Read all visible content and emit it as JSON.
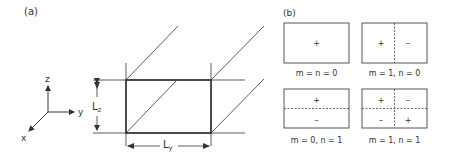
{
  "panel_a": {
    "label": "(a)",
    "axes": {
      "z": "z",
      "y": "y",
      "x": "x"
    },
    "dimension_z": {
      "main": "L",
      "sub": "z"
    },
    "dimension_y": {
      "main": "L",
      "sub": "y"
    }
  },
  "panel_b": {
    "label": "(b)",
    "modes": [
      {
        "caption": "m = n = 0",
        "signs": [
          "+"
        ]
      },
      {
        "caption": "m = 1, n = 0",
        "signs": [
          "+",
          "–"
        ]
      },
      {
        "caption": "m = 0, n = 1",
        "signs": [
          "+",
          "–"
        ]
      },
      {
        "caption": "m = 1, n = 1",
        "signs": [
          "+",
          "–",
          "–",
          "+"
        ]
      }
    ]
  }
}
